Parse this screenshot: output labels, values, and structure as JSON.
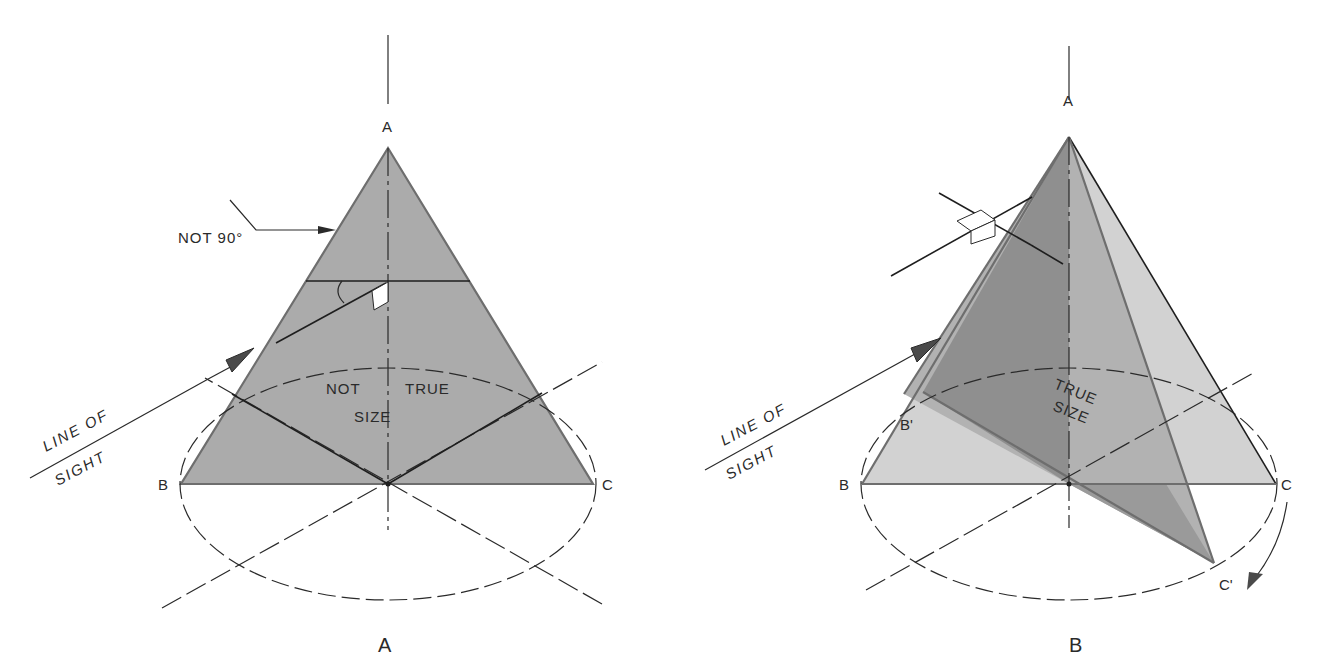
{
  "colors": {
    "background": "#ffffff",
    "line": "#2a2a2a",
    "edge": "#6e6e6e",
    "plane_a_fill": "#ababab",
    "plane_b_dark_fill": "#8f8f8f",
    "plane_b_mid_fill": "#b2b2b2",
    "plane_b_light_fill": "#d2d2d2",
    "right_angle_symbol": "#ffffff"
  },
  "figure_a": {
    "caption": "A",
    "vertex_labels": {
      "apex": "A",
      "left": "B",
      "right": "C"
    },
    "annotation_angle": "NOT 90°",
    "plane_label_line1_left": "NOT",
    "plane_label_line1_right": "TRUE",
    "plane_label_line2": "SIZE",
    "line_of_sight_line1": "LINE OF",
    "line_of_sight_line2": "SIGHT"
  },
  "figure_b": {
    "caption": "B",
    "vertex_labels": {
      "apex": "A",
      "left": "B",
      "right": "C",
      "left_rotated": "B'",
      "right_rotated": "C'"
    },
    "plane_label_line1": "TRUE",
    "plane_label_line2": "SIZE",
    "line_of_sight_line1": "LINE OF",
    "line_of_sight_line2": "SIGHT"
  }
}
